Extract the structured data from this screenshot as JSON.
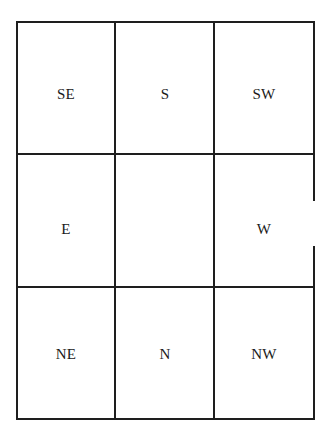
{
  "diagram": {
    "type": "3x3 directional grid",
    "rows": [
      [
        "SE",
        "S",
        "SW"
      ],
      [
        "E",
        "",
        "W"
      ],
      [
        "NE",
        "N",
        "NW"
      ]
    ],
    "cells": {
      "r0c0": "SE",
      "r0c1": "S",
      "r0c2": "SW",
      "r1c0": "E",
      "r1c1": "",
      "r1c2": "W",
      "r2c0": "NE",
      "r2c1": "N",
      "r2c2": "NW"
    },
    "line_color": "#1e1e1e",
    "background": "#ffffff"
  }
}
